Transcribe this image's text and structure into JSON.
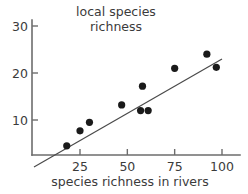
{
  "chart_data": {
    "type": "scatter",
    "title": "local species richness",
    "title_lines": [
      "local species",
      "richness"
    ],
    "xlabel": "species richness in rivers",
    "ylabel": "local species richness",
    "xlim": [
      0.7,
      104
    ],
    "ylim": [
      0,
      31
    ],
    "xticks": [
      25,
      50,
      75,
      100
    ],
    "xtick_labels": [
      "25",
      "50",
      "75",
      "100"
    ],
    "yticks": [
      10,
      20,
      30
    ],
    "ytick_labels": [
      "10",
      "20",
      "30"
    ],
    "grid": false,
    "legend": "none",
    "points": [
      {
        "x": 18,
        "y": 4.5
      },
      {
        "x": 25,
        "y": 7.7
      },
      {
        "x": 30,
        "y": 9.5
      },
      {
        "x": 47,
        "y": 13.2
      },
      {
        "x": 57,
        "y": 12.0
      },
      {
        "x": 61,
        "y": 12.0
      },
      {
        "x": 58,
        "y": 17.2
      },
      {
        "x": 75,
        "y": 21.0
      },
      {
        "x": 92,
        "y": 24.0
      },
      {
        "x": 97,
        "y": 21.2
      }
    ],
    "trend_line": {
      "type": "linear-fit",
      "x_start": 0.7,
      "y_start": 0.0,
      "x_end": 100.0,
      "y_end": 23.0
    },
    "colors": {
      "point": "#1a1a1a",
      "line": "#4a4a4a",
      "axis": "#6d6d6d",
      "text": "#3b3b3b",
      "background": "#ffffff"
    }
  }
}
